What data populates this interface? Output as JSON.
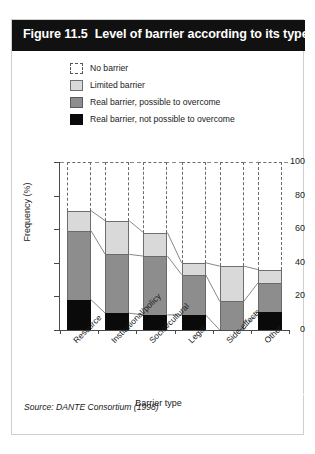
{
  "figure": {
    "number": "Figure 11.5",
    "title": "Level of barrier according to its type",
    "source": "Source: DANTE Consortium (1998)"
  },
  "legend": {
    "position": "top",
    "items": [
      {
        "label": "No barrier",
        "color": "#ffffff",
        "style": "dashed-outline",
        "icon": "legend-swatch-no-barrier"
      },
      {
        "label": "Limited barrier",
        "color": "#d9d9d9",
        "style": "solid",
        "icon": "legend-swatch-limited-barrier"
      },
      {
        "label": "Real barrier, possible to overcome",
        "color": "#8d8d8d",
        "style": "solid",
        "icon": "legend-swatch-real-possible"
      },
      {
        "label": "Real barrier, not possible to overcome",
        "color": "#0a0a0a",
        "style": "solid",
        "icon": "legend-swatch-real-not-possible"
      }
    ]
  },
  "chart_data": {
    "type": "bar",
    "stacked": true,
    "title": "Level of barrier according to its type",
    "xlabel": "Barrier type",
    "ylabel": "Frequency (%)",
    "ylim": [
      0,
      100
    ],
    "yticks": [
      0,
      20,
      40,
      60,
      80,
      100
    ],
    "ytick_labels": [
      "0",
      "20",
      "40",
      "60",
      "80",
      "100"
    ],
    "grid": false,
    "categories": [
      "Resource",
      "Institutional/policy",
      "Social/cultural",
      "Legal",
      "Side-effects",
      "Other"
    ],
    "series": [
      {
        "name": "Real barrier, not possible to overcome",
        "color": "#0a0a0a",
        "values": [
          18,
          10,
          9,
          9,
          0,
          11
        ]
      },
      {
        "name": "Real barrier, possible to overcome",
        "color": "#8d8d8d",
        "values": [
          41,
          35,
          35,
          24,
          17,
          17
        ]
      },
      {
        "name": "Limited barrier",
        "color": "#d9d9d9",
        "values": [
          12,
          20,
          14,
          7,
          21,
          8
        ]
      },
      {
        "name": "No barrier",
        "color": "#ffffff",
        "values": [
          29,
          35,
          42,
          60,
          62,
          64
        ]
      }
    ],
    "cumulative_tops": {
      "not_possible": [
        18,
        10,
        9,
        9,
        0,
        11
      ],
      "possible": [
        59,
        45,
        44,
        33,
        17,
        28
      ],
      "limited": [
        71,
        65,
        58,
        40,
        38,
        36
      ],
      "none": [
        100,
        100,
        100,
        100,
        100,
        100
      ]
    }
  }
}
